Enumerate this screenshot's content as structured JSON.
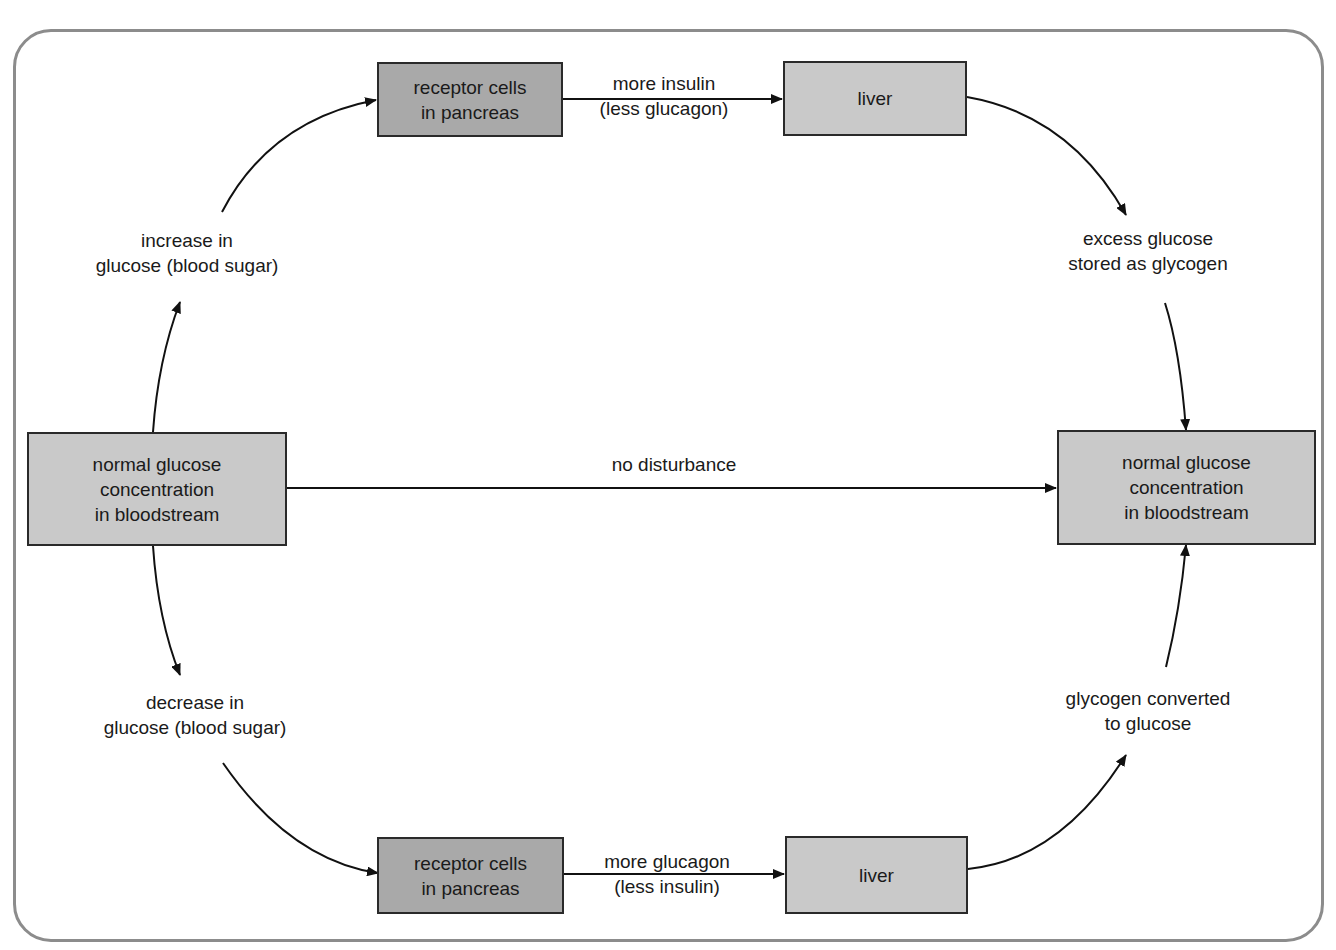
{
  "diagram": {
    "colors": {
      "frame_border": "#8c8c8c",
      "box_dark_fill": "#a9a9a9",
      "box_light_fill": "#c9c9c9",
      "box_border": "#2a2a2a",
      "arrow": "#111111"
    },
    "nodes": {
      "start": {
        "lines": [
          "normal glucose",
          "concentration",
          "in bloodstream"
        ]
      },
      "end": {
        "lines": [
          "normal glucose",
          "concentration",
          "in bloodstream"
        ]
      },
      "pancreas_top": {
        "lines": [
          "receptor cells",
          "in pancreas"
        ]
      },
      "liver_top": {
        "lines": [
          "liver"
        ]
      },
      "pancreas_bottom": {
        "lines": [
          "receptor cells",
          "in pancreas"
        ]
      },
      "liver_bottom": {
        "lines": [
          "liver"
        ]
      }
    },
    "labels": {
      "increase": {
        "lines": [
          "increase in",
          "glucose (blood sugar)"
        ]
      },
      "decrease": {
        "lines": [
          "decrease in",
          "glucose (blood sugar)"
        ]
      },
      "insulin": {
        "lines": [
          "more insulin",
          "(less glucagon)"
        ]
      },
      "glucagon": {
        "lines": [
          "more glucagon",
          "(less insulin)"
        ]
      },
      "stored": {
        "lines": [
          "excess glucose",
          "stored as glycogen"
        ]
      },
      "converted": {
        "lines": [
          "glycogen converted",
          "to glucose"
        ]
      },
      "no_disturbance": {
        "lines": [
          "no disturbance"
        ]
      }
    },
    "edges": [
      {
        "from": "start",
        "to": "increase"
      },
      {
        "from": "increase",
        "to": "pancreas_top"
      },
      {
        "from": "pancreas_top",
        "to": "liver_top",
        "label": "insulin"
      },
      {
        "from": "liver_top",
        "to": "stored"
      },
      {
        "from": "stored",
        "to": "end"
      },
      {
        "from": "start",
        "to": "end",
        "label": "no_disturbance"
      },
      {
        "from": "start",
        "to": "decrease"
      },
      {
        "from": "decrease",
        "to": "pancreas_bottom"
      },
      {
        "from": "pancreas_bottom",
        "to": "liver_bottom",
        "label": "glucagon"
      },
      {
        "from": "liver_bottom",
        "to": "converted"
      },
      {
        "from": "converted",
        "to": "end"
      }
    ]
  }
}
